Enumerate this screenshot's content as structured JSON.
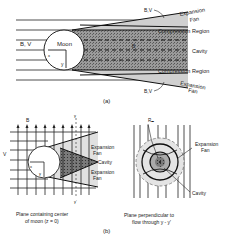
{
  "panel_a": {
    "caption": "(a)",
    "labels": {
      "bv_left": "B, V",
      "moon": "Moon",
      "x_axis": "x",
      "y_axis": "y",
      "b_inside": "B",
      "bv_top": "B,V",
      "bv_bottom": "B,V",
      "expansion_top_1": "Expansion",
      "expansion_top_2": "Fan",
      "compression_top": "Compression Region",
      "cavity": "Cavity",
      "compression_bottom": "Compression Region",
      "expansion_bottom_1": "Expansion",
      "expansion_bottom_2": "Fan"
    }
  },
  "panel_b": {
    "caption": "(b)",
    "left": {
      "b_label": "B",
      "v_label": "V",
      "y_top": "y",
      "y_bottom": "y'",
      "x_axis": "x",
      "y_axis": "y",
      "expansion_1a": "Expansion",
      "expansion_1b": "Fan",
      "cavity": "Cavity",
      "expansion_2a": "Expansion",
      "expansion_2b": "Fan",
      "caption_1": "Plane containing center",
      "caption_2": "of moon (z = 0)"
    },
    "right": {
      "rm_label": "Rₘ",
      "expansion_a": "Expansion",
      "expansion_b": "Fan",
      "cavity": "Cavity",
      "caption_1": "Plane perpendicular to",
      "caption_2": "flow through y - y'"
    }
  },
  "colors": {
    "line": "#222222",
    "shade_light": "#d8d8d8",
    "shade_dark": "#8a8a8a",
    "background": "#ffffff"
  }
}
